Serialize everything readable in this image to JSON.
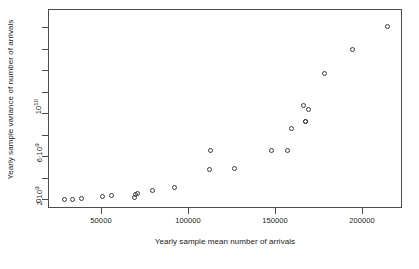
{
  "chart_data": {
    "type": "scatter",
    "title": "",
    "xlabel": "Yearly sample mean number of arrivals",
    "ylabel": "Yearly sample variance of number of arrivals",
    "xlim": [
      22000,
      225000
    ],
    "ylim": [
      0,
      16700000000
    ],
    "grid": false,
    "legend": null,
    "xticks": [
      {
        "value": 50000,
        "label": "50000",
        "px": 101
      },
      {
        "value": 100000,
        "label": "100000",
        "px": 188
      },
      {
        "value": 150000,
        "label": "150000",
        "px": 275
      },
      {
        "value": 200000,
        "label": "200000",
        "px": 362
      }
    ],
    "yticks": [
      {
        "value": 0,
        "label": "0",
        "py": 199
      },
      {
        "value": 2000000000,
        "label": "2*10^9",
        "py": 178
      },
      {
        "value": 6000000000,
        "label": "6*10^9",
        "py": 135
      },
      {
        "value": 10000000000,
        "label": "10^10",
        "py": 92
      }
    ],
    "yticks_unlabeled": [
      {
        "value": 4000000000,
        "py": 156
      },
      {
        "value": 8000000000,
        "py": 113
      },
      {
        "value": 12000000000,
        "py": 70
      },
      {
        "value": 14000000000,
        "py": 49
      },
      {
        "value": 16000000000,
        "py": 27
      }
    ],
    "marker": "open-circle",
    "marker_color": "#3a3a3a",
    "n_points": 23,
    "points": [
      {
        "x": 28600,
        "y": 120000000,
        "px": 63,
        "py": 198
      },
      {
        "x": 33200,
        "y": 150000000,
        "px": 71,
        "py": 198
      },
      {
        "x": 38400,
        "y": 230000000,
        "px": 80,
        "py": 197
      },
      {
        "x": 50000,
        "y": 400000000,
        "px": 101,
        "py": 195
      },
      {
        "x": 55200,
        "y": 490000000,
        "px": 110,
        "py": 194
      },
      {
        "x": 68400,
        "y": 300000000,
        "px": 133,
        "py": 196
      },
      {
        "x": 69000,
        "y": 580000000,
        "px": 134,
        "py": 193
      },
      {
        "x": 70100,
        "y": 680000000,
        "px": 136,
        "py": 192
      },
      {
        "x": 78700,
        "y": 960000000,
        "px": 151,
        "py": 189
      },
      {
        "x": 91400,
        "y": 1240000000,
        "px": 173,
        "py": 186
      },
      {
        "x": 111500,
        "y": 2920000000,
        "px": 208,
        "py": 168
      },
      {
        "x": 112100,
        "y": 4700000000,
        "px": 209,
        "py": 149
      },
      {
        "x": 131900,
        "y": 3010000000,
        "px": 233,
        "py": 167
      },
      {
        "x": 153200,
        "y": 4700000000,
        "px": 270,
        "py": 149
      },
      {
        "x": 162400,
        "y": 4700000000,
        "px": 286,
        "py": 149
      },
      {
        "x": 164700,
        "y": 6770000000,
        "px": 290,
        "py": 127
      },
      {
        "x": 171600,
        "y": 7520000000,
        "px": 302,
        "py": 104
      },
      {
        "x": 174500,
        "y": 7150000000,
        "px": 307,
        "py": 108
      },
      {
        "x": 172800,
        "y": 7450000000,
        "px": 304,
        "py": 120
      },
      {
        "x": 177700,
        "y": 11900000000,
        "px": 323,
        "py": 72
      },
      {
        "x": 193800,
        "y": 14100000000,
        "px": 351,
        "py": 48
      },
      {
        "x": 213900,
        "y": 16200000000,
        "px": 386,
        "py": 25
      },
      {
        "x": 299000,
        "y": 8900000000,
        "px": 304,
        "py": 120
      }
    ]
  },
  "axes": {
    "y_title": "Yearly sample variance of number of arrivals",
    "x_title": "Yearly sample mean number of arrivals",
    "y_tick_labels": [
      "0",
      "2*10^9",
      "6*10^9",
      "10^10"
    ],
    "x_tick_labels": [
      "50000",
      "100000",
      "150000",
      "200000"
    ]
  },
  "style": {
    "background": "#ffffff",
    "axis_color": "#4d4d4d",
    "text_color": "#1a1a1a",
    "marker_color": "#3a3a3a"
  }
}
